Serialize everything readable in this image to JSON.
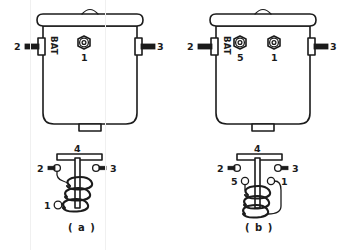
{
  "figure": {
    "background_color": "#ffffff",
    "line_color": "#1b1b1b",
    "panels": [
      {
        "id": "a",
        "caption": "( a )",
        "case_view": {
          "battery_label": "BAT",
          "left_tab_label": "2",
          "right_tab_label": "3",
          "hex_terminals": [
            {
              "label": "1",
              "position": "center"
            }
          ]
        },
        "schematic": {
          "crossbar_label": "4",
          "left_terminal_label": "2",
          "right_terminal_label": "3",
          "coil_terminal_labels": [
            "1"
          ],
          "coil_turns": 3
        }
      },
      {
        "id": "b",
        "caption": "( b )",
        "case_view": {
          "battery_label": "BAT",
          "left_tab_label": "2",
          "right_tab_label": "3",
          "hex_terminals": [
            {
              "label": "5",
              "position": "left-of-center"
            },
            {
              "label": "1",
              "position": "right-of-center"
            }
          ]
        },
        "schematic": {
          "crossbar_label": "4",
          "left_terminal_label": "2",
          "right_terminal_label": "3",
          "coil_terminal_labels": [
            "5",
            "1"
          ],
          "coil_turns": 3
        }
      }
    ]
  }
}
